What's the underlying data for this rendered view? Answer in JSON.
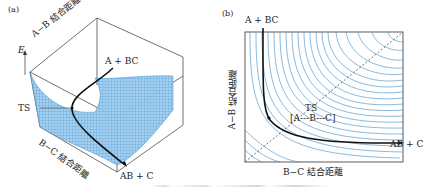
{
  "figure": {
    "panel_a": {
      "tag": "(a)",
      "axis_energy": "E",
      "axis_ab": "A−B 結合距離",
      "axis_bc": "B−C 結合距離",
      "label_reactant": "A + BC",
      "label_product": "AB + C",
      "label_ts": "TS",
      "surface_color": "#4a9fd8"
    },
    "panel_b": {
      "tag": "(b)",
      "axis_ab": "A−B 結合距離",
      "axis_bc": "B−C 結合距離",
      "label_reactant": "A + BC",
      "label_product": "AB + C",
      "label_ts": "TS",
      "label_ts_complex": "[A---B---C]",
      "contour_color": "#3d8cc4"
    }
  }
}
